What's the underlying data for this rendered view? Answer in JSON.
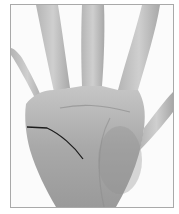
{
  "image": {
    "subject": "open right palm, grayscale photograph",
    "annotation": "hand-drawn dark line across palm (head line)",
    "colors": {
      "background": "#ffffff",
      "border": "#a9a9a9",
      "skin_light": "#c8c8c8",
      "skin_mid": "#a8a8a8",
      "skin_dark": "#8a8a8a",
      "line": "#1c1c1c"
    }
  }
}
